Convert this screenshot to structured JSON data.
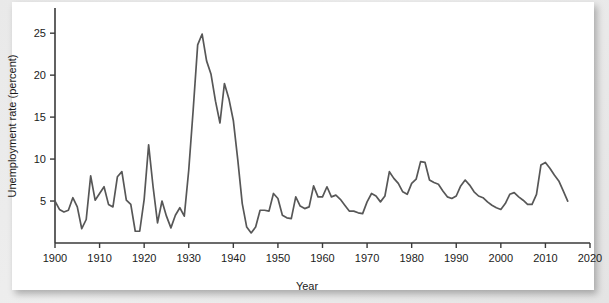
{
  "chart_data": {
    "type": "line",
    "title": "",
    "xlabel": "Year",
    "ylabel": "Unemployment rate (percent)",
    "xlim": [
      1900,
      2020
    ],
    "ylim": [
      0,
      28
    ],
    "xticks": [
      1900,
      1910,
      1920,
      1930,
      1940,
      1950,
      1960,
      1970,
      1980,
      1990,
      2000,
      2010,
      2020
    ],
    "yticks": [
      5,
      10,
      15,
      20,
      25
    ],
    "grid": false,
    "legend": null,
    "line_color": "#575757",
    "series": [
      {
        "name": "Unemployment rate",
        "x": [
          1900,
          1901,
          1902,
          1903,
          1904,
          1905,
          1906,
          1907,
          1908,
          1909,
          1910,
          1911,
          1912,
          1913,
          1914,
          1915,
          1916,
          1917,
          1918,
          1919,
          1920,
          1921,
          1922,
          1923,
          1924,
          1925,
          1926,
          1927,
          1928,
          1929,
          1930,
          1931,
          1932,
          1933,
          1934,
          1935,
          1936,
          1937,
          1938,
          1939,
          1940,
          1941,
          1942,
          1943,
          1944,
          1945,
          1946,
          1947,
          1948,
          1949,
          1950,
          1951,
          1952,
          1953,
          1954,
          1955,
          1956,
          1957,
          1958,
          1959,
          1960,
          1961,
          1962,
          1963,
          1964,
          1965,
          1966,
          1967,
          1968,
          1969,
          1970,
          1971,
          1972,
          1973,
          1974,
          1975,
          1976,
          1977,
          1978,
          1979,
          1980,
          1981,
          1982,
          1983,
          1984,
          1985,
          1986,
          1987,
          1988,
          1989,
          1990,
          1991,
          1992,
          1993,
          1994,
          1995,
          1996,
          1997,
          1998,
          1999,
          2000,
          2001,
          2002,
          2003,
          2004,
          2005,
          2006,
          2007,
          2008,
          2009,
          2010,
          2011,
          2012,
          2013,
          2014,
          2015
        ],
        "values": [
          5.0,
          4.0,
          3.7,
          3.9,
          5.4,
          4.3,
          1.7,
          2.8,
          8.0,
          5.1,
          5.9,
          6.7,
          4.6,
          4.3,
          7.9,
          8.5,
          5.1,
          4.6,
          1.4,
          1.4,
          5.2,
          11.7,
          6.7,
          2.4,
          5.0,
          3.2,
          1.8,
          3.3,
          4.2,
          3.2,
          8.7,
          15.9,
          23.6,
          24.9,
          21.7,
          20.1,
          16.9,
          14.3,
          19.0,
          17.2,
          14.6,
          9.9,
          4.7,
          1.9,
          1.2,
          1.9,
          3.9,
          3.9,
          3.8,
          5.9,
          5.3,
          3.3,
          3.0,
          2.9,
          5.5,
          4.4,
          4.1,
          4.3,
          6.8,
          5.5,
          5.5,
          6.7,
          5.5,
          5.7,
          5.2,
          4.5,
          3.8,
          3.8,
          3.6,
          3.5,
          4.9,
          5.9,
          5.6,
          4.9,
          5.6,
          8.5,
          7.7,
          7.1,
          6.1,
          5.8,
          7.1,
          7.6,
          9.7,
          9.6,
          7.5,
          7.2,
          7.0,
          6.2,
          5.5,
          5.3,
          5.6,
          6.8,
          7.5,
          6.9,
          6.1,
          5.6,
          5.4,
          4.9,
          4.5,
          4.2,
          4.0,
          4.7,
          5.8,
          6.0,
          5.5,
          5.1,
          4.6,
          4.6,
          5.8,
          9.3,
          9.6,
          8.9,
          8.1,
          7.4,
          6.2,
          5.0
        ]
      }
    ],
    "annotations": []
  },
  "axes": {
    "x_title": "Year",
    "y_title": "Unemployment rate (percent)",
    "x_tick_labels": [
      "1900",
      "1910",
      "1920",
      "1930",
      "1940",
      "1950",
      "1960",
      "1970",
      "1980",
      "1990",
      "2000",
      "2010",
      "2020"
    ],
    "y_tick_labels": [
      "5",
      "10",
      "15",
      "20",
      "25"
    ]
  }
}
